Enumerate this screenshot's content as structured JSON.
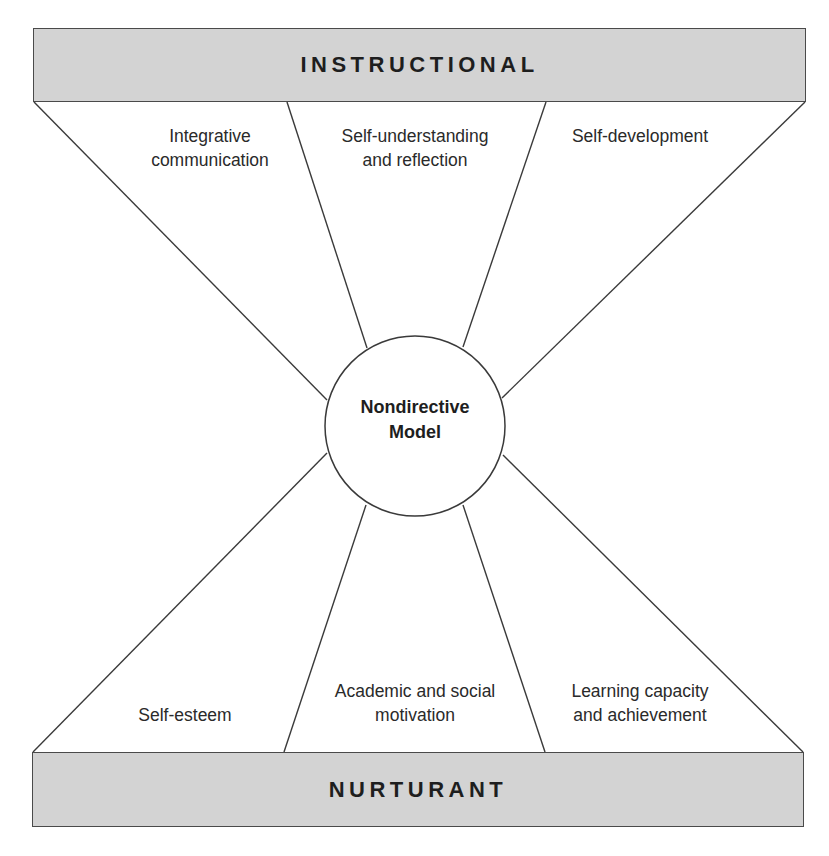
{
  "diagram": {
    "top_bar": {
      "label": "INSTRUCTIONAL"
    },
    "bottom_bar": {
      "label": "NURTURANT"
    },
    "center": {
      "line1": "Nondirective",
      "line2": "Model"
    },
    "instructional_effects": [
      {
        "line1": "Integrative",
        "line2": "communication"
      },
      {
        "line1": "Self-understanding",
        "line2": "and reflection"
      },
      {
        "line1": "Self-development",
        "line2": ""
      }
    ],
    "nurturant_effects": [
      {
        "line1": "Self-esteem",
        "line2": ""
      },
      {
        "line1": "Academic and social",
        "line2": "motivation"
      },
      {
        "line1": "Learning capacity",
        "line2": "and achievement"
      }
    ],
    "colors": {
      "bar_fill": "#d3d3d3",
      "bar_border": "#4a4a4a",
      "line": "#3a3a3a",
      "background": "#ffffff"
    }
  }
}
